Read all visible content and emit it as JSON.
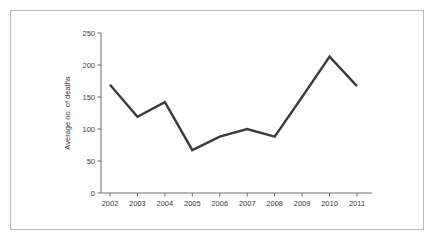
{
  "chart_data": {
    "type": "line",
    "title": "",
    "subtitle": "",
    "xlabel": "",
    "ylabel": "Average no. of deaths",
    "categories": [
      "2002",
      "2003",
      "2004",
      "2005",
      "2006",
      "2007",
      "2008",
      "2009",
      "2010",
      "2011"
    ],
    "values": [
      169,
      119,
      142,
      67,
      88,
      100,
      88,
      150,
      213,
      167
    ],
    "series": [
      {
        "name": "Average no. of deaths",
        "values": [
          169,
          119,
          142,
          67,
          88,
          100,
          88,
          150,
          213,
          167
        ]
      }
    ],
    "ylim": [
      0,
      250
    ],
    "yticks": [
      0,
      50,
      100,
      150,
      200,
      250
    ],
    "ytick_labels": [
      "0",
      "50",
      "100",
      "150",
      "200",
      "250"
    ],
    "xtick_labels": [
      "2002",
      "2003",
      "2004",
      "2005",
      "2006",
      "2007",
      "2008",
      "2009",
      "2010",
      "2011"
    ],
    "grid": false,
    "legend": false,
    "legend_position": "none",
    "line_color": "#3b3b3b",
    "axis_color": "#6e6e6e",
    "text_color": "#3a3a3a",
    "frame_color": "#b8b8b8",
    "background_color": "#ffffff"
  }
}
